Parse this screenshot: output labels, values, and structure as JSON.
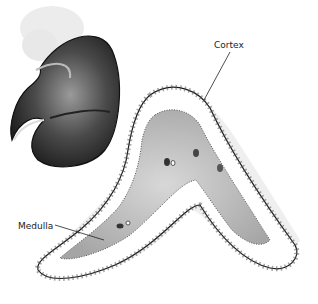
{
  "figure": {
    "labels": {
      "cortex": "Cortex",
      "medulla": "Medulla"
    },
    "colors": {
      "kidney_dark": "#2b2b2b",
      "kidney_mid": "#6a6a6a",
      "fat": "#e6e6e6",
      "medulla_fill": "#bdbdbd",
      "cortex_fill": "#ffffff",
      "outline": "#1a1a1a"
    }
  }
}
